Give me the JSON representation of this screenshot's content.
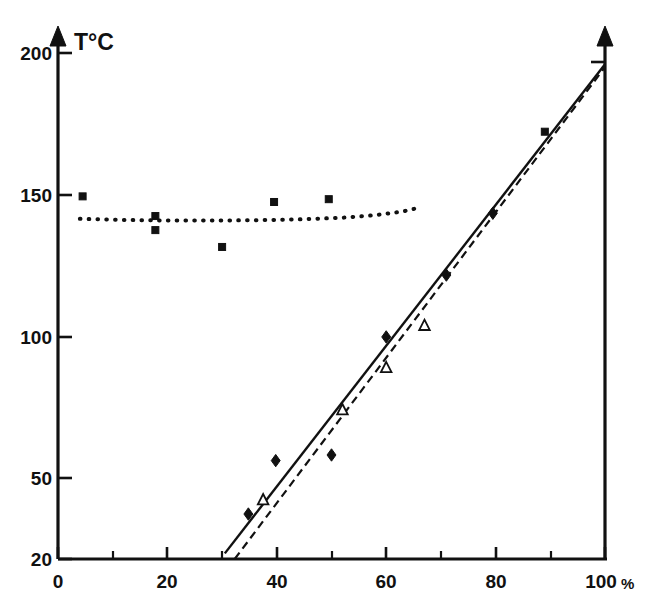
{
  "chart_data": {
    "type": "scatter",
    "title": "",
    "xlabel": "%",
    "ylabel": "T°C",
    "y_axis_title": "T°C",
    "x_unit": "%",
    "xlim": [
      0,
      100
    ],
    "ylim": [
      20,
      200
    ],
    "grid": false,
    "legend": "none",
    "x_ticks": [
      0,
      20,
      40,
      60,
      80,
      100
    ],
    "x_tick_labels": [
      "0",
      "20",
      "40",
      "60",
      "80",
      "100"
    ],
    "x_minor_ticks": [
      10,
      30,
      50,
      70,
      90
    ],
    "y_ticks": [
      20,
      50,
      100,
      150,
      200
    ],
    "y_tick_labels": [
      "20",
      "50",
      "100",
      "150",
      "200"
    ],
    "series": [
      {
        "name": "filled-squares",
        "marker": "filled-square",
        "points": [
          {
            "x": 4.5,
            "y": 149
          },
          {
            "x": 17.8,
            "y": 142
          },
          {
            "x": 17.8,
            "y": 137
          },
          {
            "x": 30.0,
            "y": 131
          },
          {
            "x": 39.5,
            "y": 147
          },
          {
            "x": 49.5,
            "y": 148
          },
          {
            "x": 89.0,
            "y": 172
          }
        ]
      },
      {
        "name": "filled-diamonds",
        "marker": "filled-diamond",
        "points": [
          {
            "x": 34.8,
            "y": 36
          },
          {
            "x": 39.8,
            "y": 55
          },
          {
            "x": 50.0,
            "y": 57
          },
          {
            "x": 60.0,
            "y": 99
          },
          {
            "x": 71.0,
            "y": 121
          },
          {
            "x": 79.5,
            "y": 143
          }
        ]
      },
      {
        "name": "open-triangles",
        "marker": "open-triangle",
        "points": [
          {
            "x": 37.5,
            "y": 41
          },
          {
            "x": 52.0,
            "y": 73
          },
          {
            "x": 60.0,
            "y": 88
          },
          {
            "x": 67.0,
            "y": 103
          }
        ]
      }
    ],
    "fit_lines": [
      {
        "name": "solid-trend-line",
        "style": "solid",
        "x_start": 30.5,
        "y_start": 22,
        "x_end": 100,
        "y_end": 196
      },
      {
        "name": "dashed-trend-line",
        "style": "dashed",
        "x_start": 32.3,
        "y_start": 20,
        "x_end": 100,
        "y_end": 195
      }
    ],
    "dotted_curve": {
      "name": "dotted-plateau-curve",
      "style": "dotted",
      "points": [
        {
          "x": 4.0,
          "y": 141
        },
        {
          "x": 12.0,
          "y": 140.6
        },
        {
          "x": 20.0,
          "y": 140.4
        },
        {
          "x": 28.0,
          "y": 140.4
        },
        {
          "x": 36.0,
          "y": 140.5
        },
        {
          "x": 44.0,
          "y": 140.8
        },
        {
          "x": 52.0,
          "y": 141.4
        },
        {
          "x": 58.0,
          "y": 142.3
        },
        {
          "x": 63.0,
          "y": 143.6
        },
        {
          "x": 66.5,
          "y": 145.2
        }
      ]
    },
    "right_axis": {
      "name": "right-vertical-axis",
      "x": 100,
      "y_bottom": 20,
      "y_top": 205,
      "tick_at": 198
    }
  },
  "axes": {
    "y_title": "T°C",
    "x_unit_suffix": "%"
  }
}
